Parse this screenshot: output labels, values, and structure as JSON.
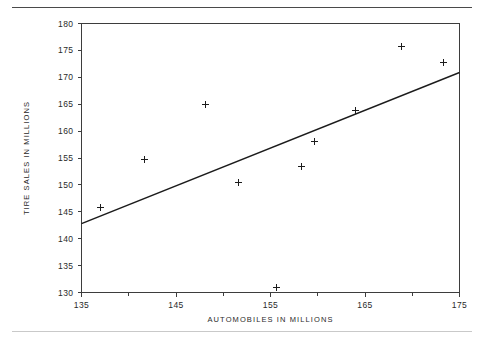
{
  "figure": {
    "rule_top": "horizontal-rule",
    "rule_bottom": "horizontal-rule"
  },
  "chart_data": {
    "type": "scatter",
    "title": "",
    "xlabel": "AUTOMOBILES IN MILLIONS",
    "ylabel": "TIRE SALES IN MILLIONS",
    "xlim": [
      135,
      175
    ],
    "ylim": [
      130,
      180
    ],
    "xticks": [
      135,
      145,
      155,
      165,
      175
    ],
    "xticklabels": [
      "135",
      "145",
      "155",
      "165",
      "175"
    ],
    "xminorticks": [
      140,
      150,
      160,
      170
    ],
    "yticks": [
      130,
      135,
      140,
      145,
      150,
      155,
      160,
      165,
      170,
      175,
      180
    ],
    "yticklabels": [
      "130",
      "135",
      "140",
      "145",
      "150",
      "155",
      "160",
      "165",
      "170",
      "175",
      "180"
    ],
    "grid": false,
    "legend": null,
    "marker": "plus",
    "marker_color": "#1c1c1c",
    "points": [
      {
        "x": 137.0,
        "y": 145.8
      },
      {
        "x": 141.6,
        "y": 154.9
      },
      {
        "x": 148.1,
        "y": 165.0
      },
      {
        "x": 151.6,
        "y": 150.5
      },
      {
        "x": 155.6,
        "y": 131.1
      },
      {
        "x": 158.2,
        "y": 153.6
      },
      {
        "x": 159.6,
        "y": 158.1
      },
      {
        "x": 163.9,
        "y": 164.0
      },
      {
        "x": 168.8,
        "y": 175.9
      },
      {
        "x": 173.3,
        "y": 172.8
      }
    ],
    "fit_line": {
      "name": "regression-line",
      "color": "#1c1c1c",
      "x0": 135.0,
      "y0": 142.8,
      "x1": 175.0,
      "y1": 170.9
    }
  }
}
